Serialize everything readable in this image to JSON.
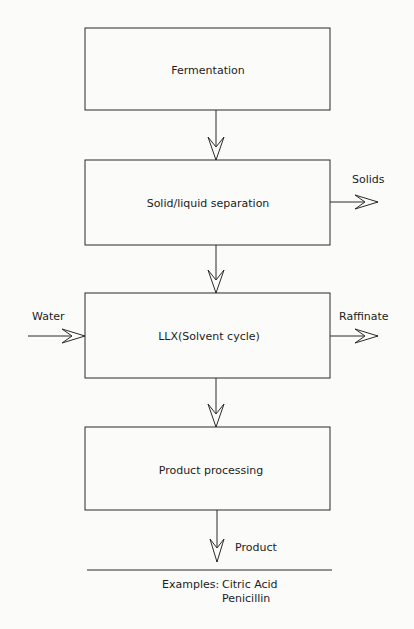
{
  "header_fragment": "gure ... Concept processing ... flow diagram ... by ...",
  "diagram": {
    "nodes": [
      {
        "id": "fermentation",
        "label": "Fermentation"
      },
      {
        "id": "solid_liquid",
        "label": "Solid/liquid separation"
      },
      {
        "id": "llx",
        "label": "LLX(Solvent cycle)"
      },
      {
        "id": "product_processing",
        "label": "Product processing"
      }
    ],
    "side_streams": {
      "solids": "Solids",
      "water": "Water",
      "raffinate": "Raffinate",
      "product": "Product"
    },
    "edges": [
      {
        "from": "fermentation",
        "to": "solid_liquid"
      },
      {
        "from": "solid_liquid",
        "to": "llx"
      },
      {
        "from": "llx",
        "to": "product_processing"
      },
      {
        "from": "solid_liquid",
        "to": "Solids"
      },
      {
        "from": "Water",
        "to": "llx"
      },
      {
        "from": "llx",
        "to": "Raffinate"
      },
      {
        "from": "product_processing",
        "to": "Product"
      }
    ],
    "examples_label": "Examples:",
    "examples": [
      "Citric Acid",
      "Penicillin"
    ]
  }
}
